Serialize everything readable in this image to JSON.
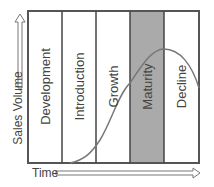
{
  "diagram": {
    "y_axis_label": "Sales Volume",
    "x_axis_label": "Time",
    "stages": [
      {
        "label": "Development",
        "fill": "#ffffff"
      },
      {
        "label": "Introduction",
        "fill": "#ffffff"
      },
      {
        "label": "Growth",
        "fill": "#ffffff"
      },
      {
        "label": "Maturity",
        "fill": "#aaaaaa"
      },
      {
        "label": "Decline",
        "fill": "#ffffff"
      }
    ],
    "colors": {
      "border": "#555555",
      "curve": "#777777",
      "highlight": "#aaaaaa",
      "text": "#444444"
    }
  }
}
